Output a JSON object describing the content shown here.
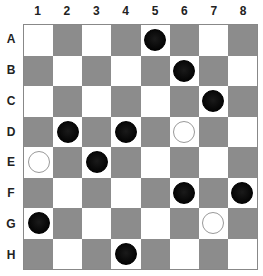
{
  "board": {
    "columns": [
      "1",
      "2",
      "3",
      "4",
      "5",
      "6",
      "7",
      "8"
    ],
    "rows": [
      "A",
      "B",
      "C",
      "D",
      "E",
      "F",
      "G",
      "H"
    ],
    "colors": {
      "light": "#ffffff",
      "dark": "#8c8c8c",
      "black_piece": "#0a0a0a",
      "white_piece_border": "#999999"
    },
    "pieces": [
      {
        "row": "A",
        "col": "5",
        "color": "black"
      },
      {
        "row": "B",
        "col": "6",
        "color": "black"
      },
      {
        "row": "C",
        "col": "7",
        "color": "black"
      },
      {
        "row": "D",
        "col": "2",
        "color": "black"
      },
      {
        "row": "D",
        "col": "4",
        "color": "black"
      },
      {
        "row": "D",
        "col": "6",
        "color": "white"
      },
      {
        "row": "E",
        "col": "1",
        "color": "white"
      },
      {
        "row": "E",
        "col": "3",
        "color": "black"
      },
      {
        "row": "F",
        "col": "6",
        "color": "black"
      },
      {
        "row": "F",
        "col": "8",
        "color": "black"
      },
      {
        "row": "G",
        "col": "1",
        "color": "black"
      },
      {
        "row": "G",
        "col": "7",
        "color": "white"
      },
      {
        "row": "H",
        "col": "4",
        "color": "black"
      }
    ]
  }
}
